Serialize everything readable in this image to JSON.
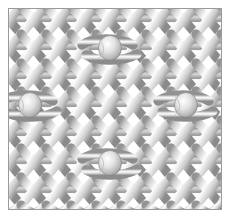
{
  "figure": {
    "background_color": "#ffffff",
    "border_color": "#9a9a9a",
    "canvas": {
      "width": 230,
      "height": 218
    },
    "plate": {
      "x": 8,
      "y": 8,
      "width": 214,
      "height": 202
    }
  },
  "yarn": {
    "name": "yarn-strand",
    "highlight_color": "#ffffff",
    "midtone_color": "#d9d9d9",
    "shadow_color": "#8c8c8c",
    "outline_color": "#6e6e6e",
    "core_color": "#b8b8b8",
    "strand_width": 9.5,
    "outline_width": 0.6
  },
  "lattice": {
    "course_spacing": 28.5,
    "wale_spacing": 25.0,
    "courses": 8,
    "wales": 10,
    "origin_x": 8,
    "origin_y": 8
  },
  "knots": [
    {
      "label": "knot-top-center",
      "cx": 110,
      "cy": 48,
      "r": 11
    },
    {
      "label": "knot-mid-left",
      "cx": 30,
      "cy": 105,
      "r": 11
    },
    {
      "label": "knot-mid-right",
      "cx": 186,
      "cy": 105,
      "r": 11
    },
    {
      "label": "knot-bottom-center",
      "cx": 110,
      "cy": 163,
      "r": 11
    }
  ],
  "chart_data": {
    "type": "diagram",
    "xlabel": "",
    "ylabel": "",
    "legend": [],
    "annotations": []
  }
}
